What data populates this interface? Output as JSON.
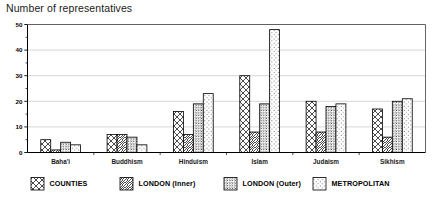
{
  "chart_data": {
    "type": "bar",
    "title": "Number of representatives",
    "xlabel": "",
    "ylabel": "",
    "ylim": [
      0,
      50
    ],
    "yticks": [
      0,
      10,
      20,
      30,
      40,
      50
    ],
    "ytick_labels": [
      "0",
      "10",
      "20",
      "30",
      "40",
      "50"
    ],
    "minor_tick_step": 5,
    "grid": true,
    "grid_axis": "y",
    "legend_position": "bottom",
    "categories": [
      "Baha'i",
      "Buddhism",
      "Hinduism",
      "Islam",
      "Judaism",
      "Sikhism"
    ],
    "series": [
      {
        "name": "COUNTIES",
        "pattern": "cross-hatch",
        "values": [
          5,
          7,
          16,
          30,
          20,
          17
        ]
      },
      {
        "name": "LONDON (Inner)",
        "pattern": "diagonal-lines",
        "values": [
          1,
          7,
          7,
          8,
          8,
          6
        ]
      },
      {
        "name": "LONDON (Outer)",
        "pattern": "dense-grid-dots",
        "values": [
          4,
          6,
          19,
          19,
          18,
          20
        ]
      },
      {
        "name": "METROPOLITAN",
        "pattern": "sparse-dots",
        "values": [
          3,
          3,
          23,
          48,
          19,
          21
        ]
      }
    ]
  },
  "legend": {
    "items": [
      {
        "label": "COUNTIES"
      },
      {
        "label": "LONDON (Inner)"
      },
      {
        "label": "LONDON (Outer)"
      },
      {
        "label": "METROPOLITAN"
      }
    ]
  },
  "colors": {
    "background": "#ffffff",
    "ink": "#000000",
    "grid": "#b9b9b9",
    "frame": "#555555"
  }
}
